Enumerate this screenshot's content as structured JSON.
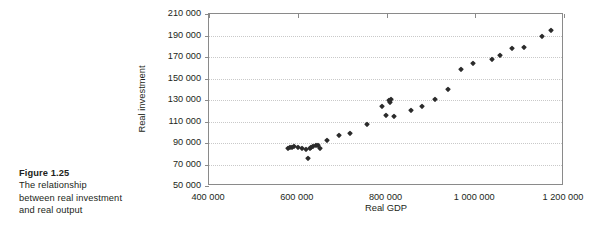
{
  "caption": {
    "title": "Figure 1.25",
    "lines": [
      "The relationship",
      "between real investment",
      "and real output"
    ]
  },
  "chart_data": {
    "type": "scatter",
    "title": "",
    "xlabel": "Real GDP",
    "ylabel": "Real investment",
    "xlim": [
      400000,
      1200000
    ],
    "ylim": [
      50000,
      210000
    ],
    "xticks": [
      400000,
      600000,
      800000,
      1000000,
      1200000
    ],
    "yticks": [
      50000,
      70000,
      90000,
      110000,
      130000,
      150000,
      170000,
      190000,
      210000
    ],
    "xtick_labels": [
      "400 000",
      "600 000",
      "800 000",
      "1 000 000",
      "1 200 000"
    ],
    "ytick_labels": [
      "50 000",
      "70 000",
      "90 000",
      "110 000",
      "130 000",
      "150 000",
      "170 000",
      "190 000",
      "210 000"
    ],
    "grid": "horizontal-dotted",
    "legend": "none",
    "marker": "diamond",
    "marker_color": "#2b2b2b",
    "series": [
      {
        "name": "Real investment vs Real GDP",
        "points": [
          [
            577000,
            85000
          ],
          [
            583000,
            86000
          ],
          [
            588000,
            86500
          ],
          [
            592000,
            87500
          ],
          [
            600000,
            86500
          ],
          [
            609000,
            85000
          ],
          [
            618000,
            84000
          ],
          [
            622000,
            76000
          ],
          [
            627000,
            85000
          ],
          [
            630000,
            86000
          ],
          [
            634000,
            87000
          ],
          [
            641000,
            88000
          ],
          [
            646000,
            88000
          ],
          [
            651000,
            85000
          ],
          [
            665000,
            93000
          ],
          [
            692000,
            97000
          ],
          [
            718000,
            99000
          ],
          [
            755000,
            108000
          ],
          [
            789000,
            124000
          ],
          [
            799000,
            116000
          ],
          [
            806000,
            130000
          ],
          [
            808000,
            128000
          ],
          [
            810000,
            131000
          ],
          [
            818000,
            115000
          ],
          [
            855000,
            121000
          ],
          [
            880000,
            124000
          ],
          [
            910000,
            131000
          ],
          [
            938000,
            140000
          ],
          [
            968000,
            159000
          ],
          [
            996000,
            164000
          ],
          [
            1038000,
            168000
          ],
          [
            1056000,
            172000
          ],
          [
            1083000,
            178000
          ],
          [
            1110000,
            179000
          ],
          [
            1150000,
            190000
          ],
          [
            1170000,
            195000
          ]
        ]
      }
    ]
  }
}
